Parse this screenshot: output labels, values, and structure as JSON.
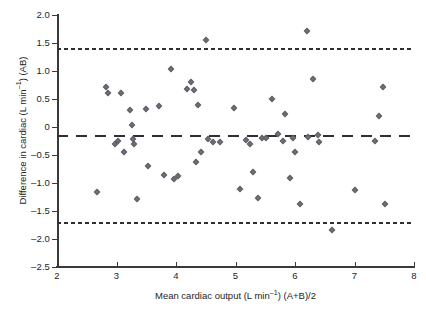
{
  "chart_data": {
    "type": "scatter",
    "title": "",
    "xlabel": "Mean cardiac output (L min⁻¹) (A+B)/2",
    "ylabel": "Difference in cardiac (L min⁻¹) (AB)",
    "xlim": [
      2,
      8
    ],
    "ylim": [
      -2.5,
      2.0
    ],
    "xticks": [
      2,
      3,
      4,
      5,
      6,
      7,
      8
    ],
    "yticks": [
      2.0,
      1.5,
      1.0,
      0.5,
      0,
      -0.5,
      -1.0,
      -1.5,
      -2.0,
      -2.5
    ],
    "ytick_labels": [
      "2.0",
      "1.5",
      "1.0",
      "0.5",
      "0",
      "–0.5",
      "–1.0",
      "–1.5",
      "–2.0",
      "–2.5"
    ],
    "xtick_labels": [
      "2",
      "3",
      "4",
      "5",
      "6",
      "7",
      "8"
    ],
    "grid": false,
    "legend": "none",
    "marker": "diamond",
    "marker_color": "#5d5d66",
    "reference_lines": [
      {
        "name": "upper-limit-of-agreement",
        "value": 1.41,
        "style": "short-dashed"
      },
      {
        "name": "mean-bias",
        "value": -0.14,
        "style": "long-dashed"
      },
      {
        "name": "lower-limit-of-agreement",
        "value": -1.7,
        "style": "short-dashed"
      }
    ],
    "points": [
      {
        "x": 2.68,
        "y": -1.16
      },
      {
        "x": 2.82,
        "y": 0.72
      },
      {
        "x": 2.86,
        "y": 0.61
      },
      {
        "x": 2.97,
        "y": -0.31
      },
      {
        "x": 3.02,
        "y": -0.25
      },
      {
        "x": 3.08,
        "y": 0.6
      },
      {
        "x": 3.13,
        "y": -0.45
      },
      {
        "x": 3.22,
        "y": 0.31
      },
      {
        "x": 3.26,
        "y": 0.04
      },
      {
        "x": 3.28,
        "y": -0.22
      },
      {
        "x": 3.3,
        "y": -0.3
      },
      {
        "x": 3.34,
        "y": -1.29
      },
      {
        "x": 3.5,
        "y": 0.33
      },
      {
        "x": 3.53,
        "y": -0.7
      },
      {
        "x": 3.72,
        "y": 0.37
      },
      {
        "x": 3.8,
        "y": -0.85
      },
      {
        "x": 3.92,
        "y": 1.04
      },
      {
        "x": 3.96,
        "y": -0.92
      },
      {
        "x": 4.04,
        "y": -0.87
      },
      {
        "x": 4.19,
        "y": 0.68
      },
      {
        "x": 4.26,
        "y": 0.8
      },
      {
        "x": 4.3,
        "y": 0.66
      },
      {
        "x": 4.33,
        "y": -0.62
      },
      {
        "x": 4.37,
        "y": 0.39
      },
      {
        "x": 4.42,
        "y": -0.45
      },
      {
        "x": 4.5,
        "y": 1.56
      },
      {
        "x": 4.54,
        "y": -0.21
      },
      {
        "x": 4.62,
        "y": -0.26
      },
      {
        "x": 4.74,
        "y": -0.26
      },
      {
        "x": 4.98,
        "y": 0.34
      },
      {
        "x": 5.08,
        "y": -1.1
      },
      {
        "x": 5.18,
        "y": -0.24
      },
      {
        "x": 5.24,
        "y": -0.31
      },
      {
        "x": 5.3,
        "y": -0.8
      },
      {
        "x": 5.38,
        "y": -1.26
      },
      {
        "x": 5.44,
        "y": -0.2
      },
      {
        "x": 5.52,
        "y": -0.19
      },
      {
        "x": 5.62,
        "y": 0.5
      },
      {
        "x": 5.72,
        "y": -0.12
      },
      {
        "x": 5.8,
        "y": -0.25
      },
      {
        "x": 5.84,
        "y": 0.24
      },
      {
        "x": 5.92,
        "y": -0.91
      },
      {
        "x": 5.96,
        "y": -0.19
      },
      {
        "x": 6.0,
        "y": -0.45
      },
      {
        "x": 6.08,
        "y": -1.38
      },
      {
        "x": 6.2,
        "y": 1.71
      },
      {
        "x": 6.22,
        "y": -0.18
      },
      {
        "x": 6.3,
        "y": 0.85
      },
      {
        "x": 6.38,
        "y": -0.15
      },
      {
        "x": 6.4,
        "y": -0.26
      },
      {
        "x": 6.62,
        "y": -1.84
      },
      {
        "x": 7.0,
        "y": -1.13
      },
      {
        "x": 7.34,
        "y": -0.25
      },
      {
        "x": 7.42,
        "y": 0.19
      },
      {
        "x": 7.48,
        "y": 0.72
      },
      {
        "x": 7.52,
        "y": -1.38
      }
    ]
  }
}
